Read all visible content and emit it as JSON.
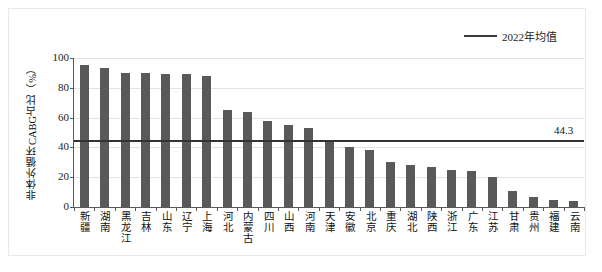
{
  "chart_data": {
    "type": "bar",
    "title": "",
    "xlabel": "",
    "ylabel": "非体外循环CABG占比（%）",
    "ylim": [
      0,
      100
    ],
    "yticks": [
      0,
      20,
      40,
      60,
      80,
      100
    ],
    "grid": true,
    "legend_position": "top-right",
    "legend": [
      {
        "name": "2022年均值",
        "type": "line",
        "color": "#3a3a3a"
      }
    ],
    "bar_color": "#595959",
    "categories": [
      "新疆",
      "湖南",
      "黑龙江",
      "吉林",
      "山东",
      "辽宁",
      "上海",
      "河北",
      "内蒙古",
      "四川",
      "山西",
      "河南",
      "天津",
      "安徽",
      "北京",
      "重庆",
      "湖北",
      "陕西",
      "浙江",
      "广东",
      "江苏",
      "甘肃",
      "贵州",
      "福建",
      "云南"
    ],
    "values": [
      95,
      93,
      90,
      90,
      89,
      89,
      88,
      65,
      64,
      58,
      55,
      53,
      45,
      40,
      38,
      30,
      28,
      27,
      25,
      24,
      20,
      11,
      7,
      5,
      4
    ],
    "reference_line": {
      "label": "2022年均值",
      "value": 44.3,
      "value_label": "44.3",
      "color": "#333333"
    },
    "annotations": [
      {
        "text": "44.3",
        "value": 44.3
      }
    ]
  }
}
